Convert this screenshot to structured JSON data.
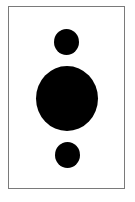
{
  "figure": {
    "frame": {
      "border_color": "#7a7a7a",
      "background": "#ffffff"
    },
    "circles": [
      {
        "name": "top-small-circle",
        "cx": 67,
        "cy": 42,
        "w": 25,
        "h": 26,
        "color": "#000000"
      },
      {
        "name": "center-large-circle",
        "cx": 67,
        "cy": 98,
        "w": 62,
        "h": 65,
        "color": "#000000"
      },
      {
        "name": "bottom-small-circle",
        "cx": 67,
        "cy": 155,
        "w": 25,
        "h": 26,
        "color": "#000000"
      }
    ]
  }
}
